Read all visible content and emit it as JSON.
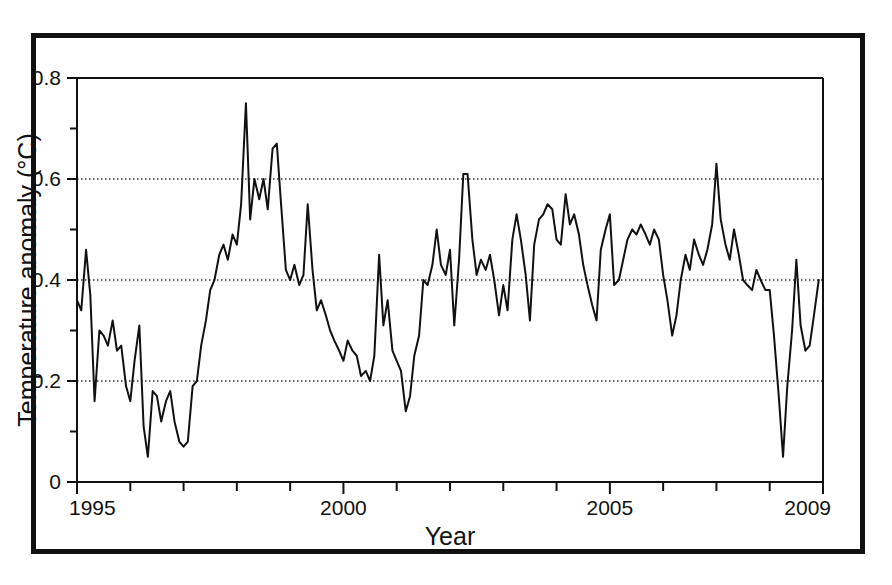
{
  "chart_data": {
    "type": "line",
    "title": "",
    "xlabel": "Year",
    "ylabel": "Temperature anomaly (°C)",
    "xlim": [
      1995,
      2009
    ],
    "ylim": [
      0,
      0.8
    ],
    "grid": true,
    "grid_values": [
      0.2,
      0.4,
      0.6
    ],
    "legend": "none",
    "x_major_ticks": [
      1995,
      2000,
      2005,
      2009
    ],
    "x_major_tick_labels": [
      "1995",
      "2000",
      "2005",
      "2009"
    ],
    "x_minor_ticks": [
      1996,
      1997,
      1998,
      1999,
      2001,
      2002,
      2003,
      2004,
      2006,
      2007,
      2008
    ],
    "y_major_ticks": [
      0,
      0.2,
      0.4,
      0.6,
      0.8
    ],
    "y_major_tick_labels": [
      "0",
      "0.2",
      "0.4",
      "0.6",
      "0.8"
    ],
    "y_minor_ticks": [
      0.1,
      0.3,
      0.5,
      0.7
    ],
    "line_color": "#111111",
    "line_width": 2,
    "series": [
      {
        "name": "Global monthly temperature anomaly",
        "x": [
          1995.0,
          1995.08,
          1995.17,
          1995.25,
          1995.33,
          1995.42,
          1995.5,
          1995.58,
          1995.67,
          1995.75,
          1995.83,
          1995.92,
          1996.0,
          1996.08,
          1996.17,
          1996.25,
          1996.33,
          1996.42,
          1996.5,
          1996.58,
          1996.67,
          1996.75,
          1996.83,
          1996.92,
          1997.0,
          1997.08,
          1997.17,
          1997.25,
          1997.33,
          1997.42,
          1997.5,
          1997.58,
          1997.67,
          1997.75,
          1997.83,
          1997.92,
          1998.0,
          1998.08,
          1998.17,
          1998.25,
          1998.33,
          1998.42,
          1998.5,
          1998.58,
          1998.67,
          1998.75,
          1998.83,
          1998.92,
          1999.0,
          1999.08,
          1999.17,
          1999.25,
          1999.33,
          1999.42,
          1999.5,
          1999.58,
          1999.67,
          1999.75,
          1999.83,
          1999.92,
          2000.0,
          2000.08,
          2000.17,
          2000.25,
          2000.33,
          2000.42,
          2000.5,
          2000.58,
          2000.67,
          2000.75,
          2000.83,
          2000.92,
          2001.0,
          2001.08,
          2001.17,
          2001.25,
          2001.33,
          2001.42,
          2001.5,
          2001.58,
          2001.67,
          2001.75,
          2001.83,
          2001.92,
          2002.0,
          2002.08,
          2002.17,
          2002.25,
          2002.33,
          2002.42,
          2002.5,
          2002.58,
          2002.67,
          2002.75,
          2002.83,
          2002.92,
          2003.0,
          2003.08,
          2003.17,
          2003.25,
          2003.33,
          2003.42,
          2003.5,
          2003.58,
          2003.67,
          2003.75,
          2003.83,
          2003.92,
          2004.0,
          2004.08,
          2004.17,
          2004.25,
          2004.33,
          2004.42,
          2004.5,
          2004.58,
          2004.67,
          2004.75,
          2004.83,
          2004.92,
          2005.0,
          2005.08,
          2005.17,
          2005.25,
          2005.33,
          2005.42,
          2005.5,
          2005.58,
          2005.67,
          2005.75,
          2005.83,
          2005.92,
          2006.0,
          2006.08,
          2006.17,
          2006.25,
          2006.33,
          2006.42,
          2006.5,
          2006.58,
          2006.67,
          2006.75,
          2006.83,
          2006.92,
          2007.0,
          2007.08,
          2007.17,
          2007.25,
          2007.33,
          2007.42,
          2007.5,
          2007.58,
          2007.67,
          2007.75,
          2007.83,
          2007.92,
          2008.0,
          2008.08,
          2008.17,
          2008.25,
          2008.33,
          2008.42,
          2008.5,
          2008.58,
          2008.67,
          2008.75,
          2008.83,
          2008.92
        ],
        "values": [
          0.36,
          0.34,
          0.46,
          0.37,
          0.16,
          0.3,
          0.29,
          0.27,
          0.32,
          0.26,
          0.27,
          0.19,
          0.16,
          0.24,
          0.31,
          0.11,
          0.05,
          0.18,
          0.17,
          0.12,
          0.16,
          0.18,
          0.12,
          0.08,
          0.07,
          0.08,
          0.19,
          0.2,
          0.27,
          0.32,
          0.38,
          0.4,
          0.45,
          0.47,
          0.44,
          0.49,
          0.47,
          0.55,
          0.75,
          0.52,
          0.6,
          0.56,
          0.6,
          0.54,
          0.66,
          0.67,
          0.55,
          0.42,
          0.4,
          0.43,
          0.39,
          0.41,
          0.55,
          0.42,
          0.34,
          0.36,
          0.33,
          0.3,
          0.28,
          0.26,
          0.24,
          0.28,
          0.26,
          0.25,
          0.21,
          0.22,
          0.2,
          0.25,
          0.45,
          0.31,
          0.36,
          0.26,
          0.24,
          0.22,
          0.14,
          0.17,
          0.25,
          0.29,
          0.4,
          0.39,
          0.43,
          0.5,
          0.43,
          0.41,
          0.46,
          0.31,
          0.44,
          0.61,
          0.61,
          0.48,
          0.41,
          0.44,
          0.42,
          0.45,
          0.4,
          0.33,
          0.39,
          0.34,
          0.48,
          0.53,
          0.48,
          0.41,
          0.32,
          0.47,
          0.52,
          0.53,
          0.55,
          0.54,
          0.48,
          0.47,
          0.57,
          0.51,
          0.53,
          0.49,
          0.43,
          0.39,
          0.35,
          0.32,
          0.46,
          0.5,
          0.53,
          0.39,
          0.4,
          0.44,
          0.48,
          0.5,
          0.49,
          0.51,
          0.49,
          0.47,
          0.5,
          0.48,
          0.41,
          0.36,
          0.29,
          0.33,
          0.4,
          0.45,
          0.42,
          0.48,
          0.45,
          0.43,
          0.46,
          0.51,
          0.63,
          0.52,
          0.47,
          0.44,
          0.5,
          0.45,
          0.4,
          0.39,
          0.38,
          0.42,
          0.4,
          0.38,
          0.38,
          0.29,
          0.17,
          0.05,
          0.19,
          0.3,
          0.44,
          0.31,
          0.26,
          0.27,
          0.33,
          0.4
        ]
      }
    ]
  }
}
